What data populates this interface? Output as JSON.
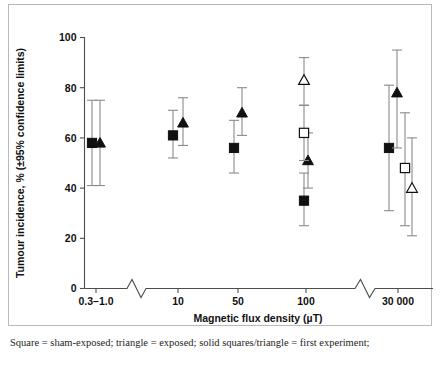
{
  "figure": {
    "caption": "Square = sham-exposed; triangle = exposed; solid squares/triangle = first experiment;"
  },
  "chart_data": {
    "type": "scatter",
    "title": "",
    "xlabel": "Magnetic flux density (µT)",
    "ylabel": "Tumour incidence, % (±95% confidence limits)",
    "ylim": [
      0,
      100
    ],
    "yticks": [
      0,
      20,
      40,
      60,
      80,
      100
    ],
    "ytick_labels": [
      "0",
      "20",
      "40",
      "60",
      "80",
      "100"
    ],
    "grid": false,
    "legend_position": "none",
    "axis_breaks": [
      {
        "after_category": "0.3–1.0",
        "style": "zigzag"
      },
      {
        "after_category": "100",
        "style": "zigzag"
      }
    ],
    "categories": [
      "0.3–1.0",
      "10",
      "50",
      "100",
      "30 000"
    ],
    "xtick_labels": [
      "0.3–1.0",
      "10",
      "50",
      "100",
      "30 000"
    ],
    "marker_legend": [
      {
        "name": "sham-exposed, first experiment",
        "marker": "solid-square"
      },
      {
        "name": "exposed, first experiment",
        "marker": "solid-triangle"
      },
      {
        "name": "sham-exposed, second experiment",
        "marker": "open-square"
      },
      {
        "name": "exposed, second experiment",
        "marker": "open-triangle"
      }
    ],
    "series": [
      {
        "name": "solid-square",
        "marker": "solid-square",
        "points": [
          {
            "category": "0.3–1.0",
            "value": 58,
            "ci_low": 41,
            "ci_high": 75
          },
          {
            "category": "10",
            "value": 61,
            "ci_low": 52,
            "ci_high": 71
          },
          {
            "category": "50",
            "value": 56,
            "ci_low": 46,
            "ci_high": 67
          },
          {
            "category": "100",
            "value": 35,
            "ci_low": 25,
            "ci_high": 46
          },
          {
            "category": "30 000",
            "value": 56,
            "ci_low": 31,
            "ci_high": 81
          }
        ]
      },
      {
        "name": "solid-triangle",
        "marker": "solid-triangle",
        "points": [
          {
            "category": "0.3–1.0",
            "value": 58,
            "ci_low": 41,
            "ci_high": 75
          },
          {
            "category": "10",
            "value": 66,
            "ci_low": 57,
            "ci_high": 76
          },
          {
            "category": "50",
            "value": 70,
            "ci_low": 61,
            "ci_high": 80
          },
          {
            "category": "100",
            "value": 51,
            "ci_low": 40,
            "ci_high": 62
          },
          {
            "category": "30 000",
            "value": 78,
            "ci_low": 56,
            "ci_high": 95
          }
        ]
      },
      {
        "name": "open-square",
        "marker": "open-square",
        "points": [
          {
            "category": "100",
            "value": 62,
            "ci_low": 51,
            "ci_high": 73
          },
          {
            "category": "30 000",
            "value": 48,
            "ci_low": 25,
            "ci_high": 70
          }
        ]
      },
      {
        "name": "open-triangle",
        "marker": "open-triangle",
        "points": [
          {
            "category": "100",
            "value": 83,
            "ci_low": 73,
            "ci_high": 92
          },
          {
            "category": "30 000",
            "value": 40,
            "ci_low": 21,
            "ci_high": 60
          }
        ]
      }
    ]
  }
}
